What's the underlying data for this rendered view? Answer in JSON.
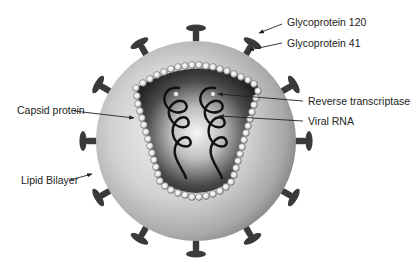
{
  "diagram": {
    "colors": {
      "background": "#ffffff",
      "envelope_light": "#e8e8e8",
      "envelope_dark": "#8a8a8a",
      "core_dark": "#1e1e1e",
      "core_light": "#f2f2f2",
      "spike": "#3a3a3a",
      "text": "#222222"
    },
    "labels": [
      {
        "id": "gp120",
        "text": "Glycoprotein 120"
      },
      {
        "id": "gp41",
        "text": "Glycoprotein 41"
      },
      {
        "id": "reverse-transcriptase",
        "text": "Reverse transcriptase"
      },
      {
        "id": "viral-rna",
        "text": "Viral RNA"
      },
      {
        "id": "capsid-protein",
        "text": "Capsid protein"
      },
      {
        "id": "lipid-bilayer",
        "text": "Lipid Bilayer"
      }
    ],
    "components": {
      "envelope_spikes": 12,
      "rna_strands": 2
    }
  }
}
